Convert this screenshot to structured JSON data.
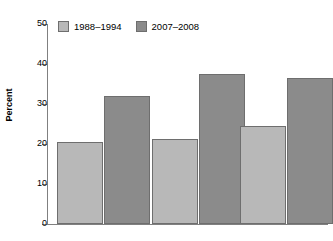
{
  "caption_remnant": "",
  "chart_data": {
    "type": "bar",
    "title": "",
    "xlabel": "",
    "ylabel": "Percent",
    "ylim": [
      0,
      50
    ],
    "yticks": [
      0,
      10,
      20,
      30,
      40,
      50
    ],
    "ytick_labels": [
      "0",
      "10",
      "20",
      "30",
      "40",
      "50"
    ],
    "grid": false,
    "legend_position": "top-left",
    "categories": [
      "Group 1",
      "Group 2",
      "Group 3"
    ],
    "series": [
      {
        "name": "1988–1994",
        "color": "#b8b8b8",
        "values": [
          20.4,
          21.3,
          24.4
        ]
      },
      {
        "name": "2007–2008",
        "color": "#8b8b8b",
        "values": [
          32.0,
          37.6,
          36.4
        ]
      }
    ]
  },
  "legend": {
    "items": [
      {
        "label": "1988–1994",
        "swatch": "light"
      },
      {
        "label": "2007–2008",
        "swatch": "dark"
      }
    ]
  },
  "axis": {
    "y_title": "Percent",
    "y_labels": [
      "50",
      "40",
      "30",
      "20",
      "10",
      "0"
    ]
  }
}
